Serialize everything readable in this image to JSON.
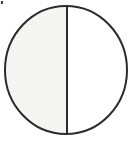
{
  "figure": {
    "name": "circle-divided-by-vertical-diameter",
    "canvas": {
      "width": 133,
      "height": 141,
      "background_color": "#ffffff"
    },
    "circle": {
      "label": "circle-outline",
      "center_x": 66,
      "center_y": 70,
      "radius_x": 62,
      "radius_y": 65,
      "stroke_color": "#2b2b2b",
      "stroke_width": 2,
      "fill_color": "#ffffff"
    },
    "divider": {
      "label": "vertical-diameter-line",
      "x": 67,
      "y_top": 5,
      "y_bottom": 135,
      "stroke_color": "#2b2b2b",
      "stroke_width": 2
    },
    "halves": [
      {
        "name": "left-half",
        "side": "left",
        "fill_color": "#f5f5f3",
        "shaded": true
      },
      {
        "name": "right-half",
        "side": "right",
        "fill_color": "#ffffff",
        "shaded": false
      }
    ],
    "artifact": {
      "name": "scan-speck",
      "x": 1,
      "y": 1,
      "width": 2,
      "height": 3,
      "color": "#3a3a3a"
    }
  }
}
